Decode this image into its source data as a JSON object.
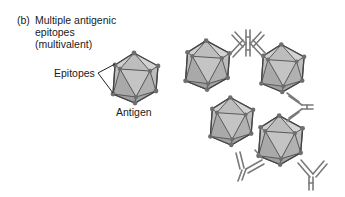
{
  "figure": {
    "panel_tag": "(b)",
    "caption_lines": [
      "Multiple antigenic",
      "epitopes",
      "(multivalent)"
    ],
    "labels": {
      "epitopes": "Epitopes",
      "antigen": "Antigen"
    },
    "colors": {
      "antigen_fill": "#bdbdbd",
      "antigen_stroke": "#555555",
      "epitope_dot": "#6e6e6e",
      "antibody_stroke": "#7a7a7a"
    },
    "antigen_count_cluster": 4,
    "antibody_count_cluster": 5
  }
}
